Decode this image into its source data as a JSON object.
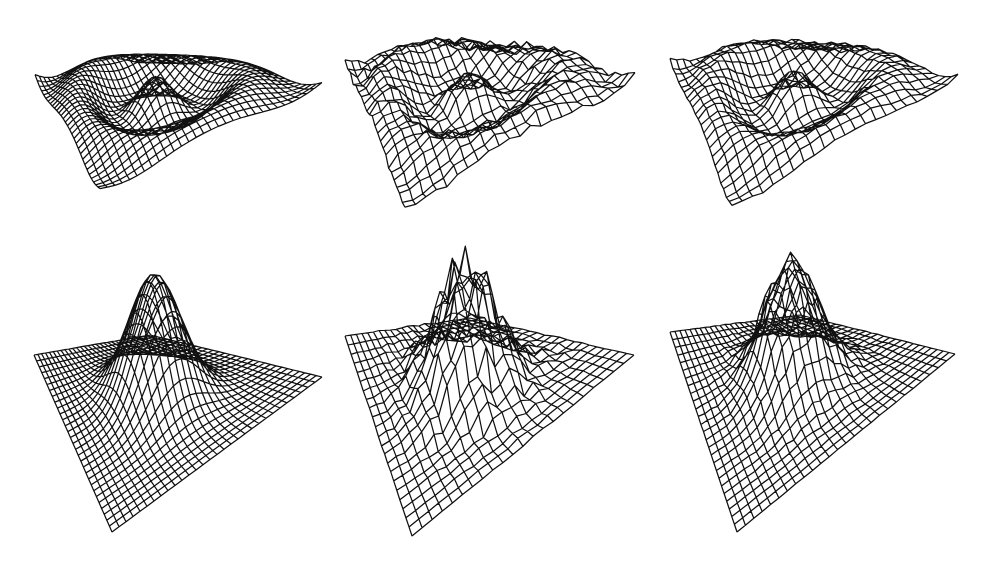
{
  "figure": {
    "background": "#ffffff",
    "line_color": "#111111",
    "rows": 2,
    "cols": 3
  },
  "chart_data": [
    {
      "type": "surface-wireframe",
      "title": "",
      "row": 0,
      "col": 0,
      "surface": "ripple",
      "description": "Concentric ripple (sinc-like) surface, smooth",
      "grid": 30,
      "amplitude": 0.35,
      "noise": 0.0,
      "box": {
        "left": 34,
        "top": 44,
        "width": 290,
        "height": 145
      },
      "view": {
        "top": [
          35,
          72
        ],
        "right": [
          322,
          80
        ],
        "back": [
          165,
          52
        ],
        "front": [
          100,
          186
        ],
        "zscale": 60
      }
    },
    {
      "type": "surface-wireframe",
      "title": "",
      "row": 0,
      "col": 1,
      "surface": "ripple",
      "description": "Concentric ripple surface with noise (noisy reconstruction)",
      "grid": 22,
      "amplitude": 0.35,
      "noise": 0.12,
      "box": {
        "left": 343,
        "top": 30,
        "width": 295,
        "height": 175
      },
      "view": {
        "top": [
          345,
          55
        ],
        "right": [
          635,
          72
        ],
        "back": [
          490,
          38
        ],
        "front": [
          405,
          202
        ],
        "zscale": 60
      }
    },
    {
      "type": "surface-wireframe",
      "title": "",
      "row": 0,
      "col": 2,
      "surface": "ripple",
      "description": "Concentric ripple surface, smoothed reconstruction",
      "grid": 22,
      "amplitude": 0.35,
      "noise": 0.06,
      "box": {
        "left": 668,
        "top": 30,
        "width": 295,
        "height": 175
      },
      "view": {
        "top": [
          670,
          55
        ],
        "right": [
          958,
          72
        ],
        "back": [
          815,
          38
        ],
        "front": [
          732,
          202
        ],
        "zscale": 60
      }
    },
    {
      "type": "surface-wireframe",
      "title": "",
      "row": 1,
      "col": 0,
      "surface": "cone",
      "description": "Smooth peaked cone surface",
      "grid": 30,
      "amplitude": 1.0,
      "noise": 0.0,
      "box": {
        "left": 30,
        "top": 226,
        "width": 295,
        "height": 310
      },
      "view": {
        "top": [
          34,
          355
        ],
        "right": [
          322,
          377
        ],
        "back": [
          150,
          335
        ],
        "front": [
          112,
          532
        ],
        "zscale": 125
      }
    },
    {
      "type": "surface-wireframe",
      "title": "",
      "row": 1,
      "col": 1,
      "surface": "cone",
      "description": "Noisy peaked cone surface",
      "grid": 22,
      "amplitude": 1.0,
      "noise": 0.18,
      "box": {
        "left": 343,
        "top": 220,
        "width": 295,
        "height": 318
      },
      "view": {
        "top": [
          345,
          336
        ],
        "right": [
          634,
          355
        ],
        "back": [
          470,
          318
        ],
        "front": [
          412,
          536
        ],
        "zscale": 125
      }
    },
    {
      "type": "surface-wireframe",
      "title": "",
      "row": 1,
      "col": 2,
      "surface": "cone",
      "description": "Smoothed peaked cone surface",
      "grid": 26,
      "amplitude": 1.0,
      "noise": 0.07,
      "box": {
        "left": 668,
        "top": 220,
        "width": 295,
        "height": 318
      },
      "view": {
        "top": [
          670,
          332
        ],
        "right": [
          955,
          354
        ],
        "back": [
          800,
          315
        ],
        "front": [
          737,
          532
        ],
        "zscale": 125
      }
    }
  ]
}
